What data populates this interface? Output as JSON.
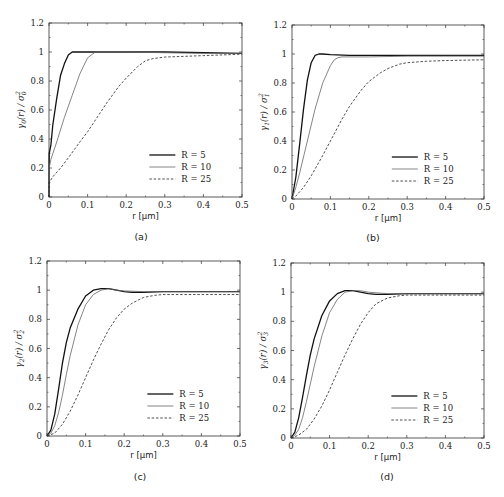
{
  "figure": {
    "page_number_fragment": "255"
  },
  "chart_data": [
    {
      "id": "a",
      "type": "line",
      "panel_label": "(a)",
      "xlabel": "r [µm]",
      "ylabel": "γ0(r) / σ0²",
      "ylabel_main": "γ",
      "ylabel_sub": "0",
      "ylabel_rest": "(r) / σ",
      "ylabel_sub2": "0",
      "ylabel_sup": "2",
      "xlim": [
        0,
        0.5
      ],
      "ylim": [
        0,
        1.2
      ],
      "xticks": [
        "0",
        "0.1",
        "0.2",
        "0.3",
        "0.4",
        "0.5"
      ],
      "yticks": [
        "0",
        "0.2",
        "0.4",
        "0.6",
        "0.8",
        "1",
        "1.2"
      ],
      "grid": false,
      "legend_position": "lower right",
      "series": [
        {
          "name": "R = 5",
          "style": "solid-thick",
          "x": [
            0,
            0.0005,
            0.005,
            0.01,
            0.02,
            0.03,
            0.04,
            0.05,
            0.06,
            0.07,
            0.1,
            0.2,
            0.3,
            0.4,
            0.5
          ],
          "y": [
            0,
            0.3,
            0.36,
            0.5,
            0.68,
            0.84,
            0.92,
            0.98,
            1.0,
            1.0,
            1.0,
            1.0,
            1.0,
            0.995,
            0.99
          ]
        },
        {
          "name": "R = 10",
          "style": "solid-thin",
          "x": [
            0,
            0.0005,
            0.005,
            0.01,
            0.02,
            0.04,
            0.06,
            0.08,
            0.1,
            0.12,
            0.15,
            0.2,
            0.3,
            0.4,
            0.5
          ],
          "y": [
            0,
            0.2,
            0.26,
            0.3,
            0.38,
            0.55,
            0.7,
            0.85,
            0.96,
            1.0,
            1.0,
            1.0,
            0.995,
            0.99,
            0.99
          ]
        },
        {
          "name": "R = 25",
          "style": "dashed",
          "x": [
            0,
            0.0005,
            0.01,
            0.03,
            0.05,
            0.08,
            0.1,
            0.13,
            0.15,
            0.18,
            0.2,
            0.23,
            0.25,
            0.27,
            0.3,
            0.35,
            0.4,
            0.5
          ],
          "y": [
            0,
            0.1,
            0.14,
            0.2,
            0.27,
            0.38,
            0.45,
            0.57,
            0.65,
            0.76,
            0.82,
            0.9,
            0.94,
            0.955,
            0.965,
            0.97,
            0.975,
            0.985
          ]
        }
      ]
    },
    {
      "id": "b",
      "type": "line",
      "panel_label": "(b)",
      "xlabel": "r [µm]",
      "ylabel": "γ1(r) / σ1²",
      "ylabel_main": "γ",
      "ylabel_sub": "1",
      "ylabel_rest": "(r) / σ",
      "ylabel_sub2": "1",
      "ylabel_sup": "2",
      "xlim": [
        0,
        0.5
      ],
      "ylim": [
        0,
        1.2
      ],
      "xticks": [
        "0",
        "0.1",
        "0.2",
        "0.3",
        "0.4",
        "0.5"
      ],
      "yticks": [
        "0",
        "0.2",
        "0.4",
        "0.6",
        "0.8",
        "1",
        "1.2"
      ],
      "grid": false,
      "legend_position": "lower right",
      "series": [
        {
          "name": "R = 5",
          "style": "solid-thick",
          "x": [
            0,
            0.01,
            0.02,
            0.03,
            0.04,
            0.05,
            0.06,
            0.07,
            0.08,
            0.1,
            0.15,
            0.2,
            0.3,
            0.4,
            0.5
          ],
          "y": [
            0,
            0.15,
            0.38,
            0.62,
            0.82,
            0.94,
            0.99,
            1.0,
            1.0,
            0.995,
            0.99,
            0.99,
            0.99,
            0.99,
            0.99
          ]
        },
        {
          "name": "R = 10",
          "style": "solid-thin",
          "x": [
            0,
            0.01,
            0.02,
            0.04,
            0.06,
            0.08,
            0.1,
            0.11,
            0.12,
            0.13,
            0.15,
            0.2,
            0.3,
            0.4,
            0.5
          ],
          "y": [
            0,
            0.08,
            0.18,
            0.4,
            0.62,
            0.8,
            0.92,
            0.96,
            0.975,
            0.98,
            0.98,
            0.98,
            0.985,
            0.985,
            0.985
          ]
        },
        {
          "name": "R = 25",
          "style": "dashed",
          "x": [
            0,
            0.01,
            0.03,
            0.05,
            0.08,
            0.1,
            0.13,
            0.15,
            0.18,
            0.2,
            0.23,
            0.25,
            0.28,
            0.3,
            0.35,
            0.4,
            0.5
          ],
          "y": [
            0,
            0.02,
            0.08,
            0.16,
            0.3,
            0.4,
            0.55,
            0.64,
            0.75,
            0.81,
            0.87,
            0.9,
            0.93,
            0.94,
            0.95,
            0.955,
            0.96
          ]
        }
      ]
    },
    {
      "id": "c",
      "type": "line",
      "panel_label": "(c)",
      "xlabel": "r [µm]",
      "ylabel": "γ2(r) / σ2²",
      "ylabel_main": "γ",
      "ylabel_sub": "2",
      "ylabel_rest": "(r) / σ",
      "ylabel_sub2": "2",
      "ylabel_sup": "2",
      "xlim": [
        0,
        0.5
      ],
      "ylim": [
        0,
        1.2
      ],
      "xticks": [
        "0",
        "0.1",
        "0.2",
        "0.3",
        "0.4",
        "0.5"
      ],
      "yticks": [
        "0",
        "0.2",
        "0.4",
        "0.6",
        "0.8",
        "1",
        "1.2"
      ],
      "grid": false,
      "legend_position": "lower right",
      "series": [
        {
          "name": "R = 5",
          "style": "solid-thick",
          "x": [
            0,
            0.01,
            0.02,
            0.03,
            0.04,
            0.05,
            0.06,
            0.08,
            0.1,
            0.12,
            0.14,
            0.16,
            0.18,
            0.2,
            0.22,
            0.25,
            0.3,
            0.4,
            0.5
          ],
          "y": [
            0,
            0.04,
            0.15,
            0.32,
            0.5,
            0.64,
            0.74,
            0.87,
            0.96,
            1.0,
            1.01,
            1.01,
            1.0,
            0.99,
            0.985,
            0.985,
            0.99,
            0.99,
            0.99
          ]
        },
        {
          "name": "R = 10",
          "style": "solid-thin",
          "x": [
            0,
            0.01,
            0.02,
            0.03,
            0.04,
            0.05,
            0.06,
            0.08,
            0.1,
            0.12,
            0.14,
            0.16,
            0.18,
            0.2,
            0.25,
            0.3,
            0.4,
            0.5
          ],
          "y": [
            0,
            0.02,
            0.07,
            0.16,
            0.28,
            0.42,
            0.55,
            0.76,
            0.9,
            0.97,
            1.0,
            1.01,
            1.0,
            0.995,
            0.99,
            0.99,
            0.99,
            0.99
          ]
        },
        {
          "name": "R = 25",
          "style": "dashed",
          "x": [
            0,
            0.02,
            0.04,
            0.06,
            0.08,
            0.1,
            0.12,
            0.14,
            0.16,
            0.18,
            0.2,
            0.22,
            0.25,
            0.28,
            0.3,
            0.35,
            0.4,
            0.5
          ],
          "y": [
            0,
            0.02,
            0.08,
            0.17,
            0.28,
            0.4,
            0.52,
            0.63,
            0.73,
            0.81,
            0.87,
            0.91,
            0.95,
            0.965,
            0.97,
            0.97,
            0.97,
            0.97
          ]
        }
      ]
    },
    {
      "id": "d",
      "type": "line",
      "panel_label": "(d)",
      "xlabel": "r [µm]",
      "ylabel": "γ3(r) / σ3²",
      "ylabel_main": "γ",
      "ylabel_sub": "3",
      "ylabel_rest": "(r) / σ",
      "ylabel_sub2": "3",
      "ylabel_sup": "2",
      "xlim": [
        0,
        0.5
      ],
      "ylim": [
        0,
        1.2
      ],
      "xticks": [
        "0",
        "0.1",
        "0.2",
        "0.3",
        "0.4",
        "0.5"
      ],
      "yticks": [
        "0",
        "0.2",
        "0.4",
        "0.6",
        "0.8",
        "1",
        "1.2"
      ],
      "grid": false,
      "legend_position": "lower right",
      "series": [
        {
          "name": "R = 5",
          "style": "solid-thick",
          "x": [
            0,
            0.01,
            0.02,
            0.03,
            0.04,
            0.05,
            0.06,
            0.08,
            0.1,
            0.12,
            0.14,
            0.16,
            0.18,
            0.2,
            0.22,
            0.25,
            0.3,
            0.4,
            0.5
          ],
          "y": [
            0,
            0.04,
            0.14,
            0.28,
            0.43,
            0.57,
            0.68,
            0.84,
            0.94,
            0.99,
            1.01,
            1.01,
            1.0,
            0.99,
            0.985,
            0.985,
            0.99,
            0.99,
            0.99
          ]
        },
        {
          "name": "R = 10",
          "style": "solid-thin",
          "x": [
            0,
            0.01,
            0.02,
            0.03,
            0.04,
            0.05,
            0.06,
            0.08,
            0.1,
            0.12,
            0.14,
            0.16,
            0.18,
            0.2,
            0.25,
            0.3,
            0.4,
            0.5
          ],
          "y": [
            0,
            0.02,
            0.06,
            0.14,
            0.25,
            0.37,
            0.49,
            0.7,
            0.86,
            0.95,
            1.0,
            1.01,
            1.01,
            1.0,
            0.99,
            0.99,
            0.99,
            0.99
          ]
        },
        {
          "name": "R = 25",
          "style": "dashed",
          "x": [
            0,
            0.02,
            0.04,
            0.06,
            0.08,
            0.1,
            0.12,
            0.14,
            0.16,
            0.18,
            0.2,
            0.22,
            0.25,
            0.28,
            0.3,
            0.35,
            0.4,
            0.5
          ],
          "y": [
            0,
            0.02,
            0.06,
            0.13,
            0.22,
            0.33,
            0.45,
            0.57,
            0.68,
            0.78,
            0.86,
            0.92,
            0.96,
            0.975,
            0.98,
            0.98,
            0.98,
            0.98
          ]
        }
      ]
    }
  ],
  "layout": {
    "panels": [
      {
        "x0": 49,
        "x1": 242,
        "y0": 197,
        "y1": 23,
        "label_x": 141,
        "label_y": 240
      },
      {
        "x0": 292,
        "x1": 484,
        "y0": 199,
        "y1": 25,
        "label_x": 373,
        "label_y": 241
      },
      {
        "x0": 47,
        "x1": 240,
        "y0": 436,
        "y1": 261,
        "label_x": 140,
        "label_y": 480
      },
      {
        "x0": 291,
        "x1": 484,
        "y0": 438,
        "y1": 263,
        "label_x": 387,
        "label_y": 480
      }
    ]
  }
}
